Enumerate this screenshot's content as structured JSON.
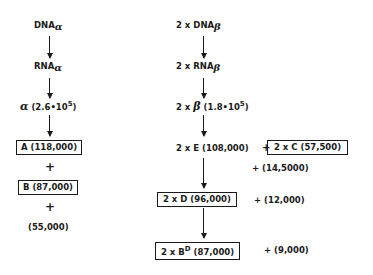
{
  "left_chain": {
    "dna": {
      "base": "DNA",
      "sub": "α"
    },
    "rna": {
      "base": "RNA",
      "sub": "α"
    },
    "protein": {
      "symbol": "α",
      "value": "(2.6•10",
      "exp": "5",
      "close": ")"
    },
    "box_a": "A (118,000)",
    "plus1": "+",
    "box_b": "B (87,000)",
    "plus2": "+",
    "remainder": "(55,000)"
  },
  "right_chain": {
    "dna": {
      "prefix": "2 x",
      "base": "DNA",
      "sub": "β"
    },
    "rna": {
      "prefix": "2 x",
      "base": "RNA",
      "sub": "β"
    },
    "protein": {
      "prefix": "2 x",
      "symbol": "β",
      "value": "(1.8•10",
      "exp": "5",
      "close": ")"
    },
    "e_line": "2 x E (108,000)",
    "e_plus": "+",
    "box_c": "2 x C (57,500)",
    "c_extra": "+ (14,5000)",
    "box_d": "2 x D (96,000)",
    "d_extra": "+ (12,000)",
    "box_bd": {
      "prefix": "2 x B",
      "sup": "D",
      "value": "(87,000)"
    },
    "bd_extra": "+ (9,000)"
  }
}
